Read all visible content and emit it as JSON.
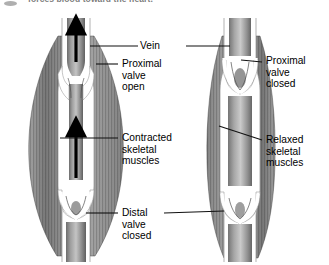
{
  "figure": {
    "caption": "forces blood toward the heart.",
    "bullet_icon": "bullet-marker-icon",
    "type": "anatomical-diagram"
  },
  "labels": {
    "vein": "Vein",
    "proximal_valve_open": [
      "Proximal",
      "valve",
      "open"
    ],
    "proximal_valve_closed": [
      "Proximal",
      "valve",
      "closed"
    ],
    "contracted_muscles": [
      "Contracted",
      "skeletal",
      "muscles"
    ],
    "relaxed_muscles": [
      "Relaxed",
      "skeletal",
      "muscles"
    ],
    "distal_valve_closed": [
      "Distal",
      "valve",
      "closed"
    ]
  },
  "panels": [
    {
      "id": "left-panel",
      "state": "muscles-contracted",
      "proximal_valve": "open",
      "distal_valve": "closed",
      "blood_flow_arrows": 2,
      "flow_direction": "upward-toward-heart"
    },
    {
      "id": "right-panel",
      "state": "muscles-relaxed",
      "proximal_valve": "closed",
      "distal_valve": "closed",
      "blood_flow_arrows": 0,
      "flow_direction": "none"
    }
  ],
  "colors": {
    "background": "#ffffff",
    "muscle_dark": "#5a5a5a",
    "muscle_mid": "#8d8d8d",
    "muscle_light": "#c2c2c2",
    "vein_wall": "#ffffff",
    "vein_lumen_dark": "#5e5e5e",
    "vein_lumen_light": "#b4b4b4",
    "leader_line": "#1a1a1a",
    "arrow": "#000000",
    "caption_text": "#4a4a4a"
  }
}
